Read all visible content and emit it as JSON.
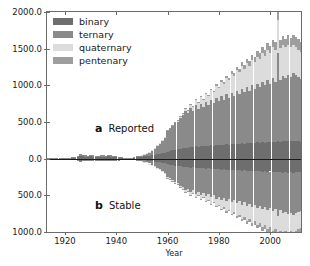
{
  "figure": {
    "width": 310,
    "height": 266,
    "background": "#ffffff"
  },
  "legend": {
    "position": "upper-left-inside",
    "entries": [
      {
        "label": "binary",
        "color": "#6e6e6e"
      },
      {
        "label": "ternary",
        "color": "#8a8a8a"
      },
      {
        "label": "quaternary",
        "color": "#dcdcdc"
      },
      {
        "label": "pentenary",
        "color": "#9e9e9e"
      }
    ]
  },
  "annotations": [
    {
      "letter": "a",
      "text": "Reported",
      "panel": "upper"
    },
    {
      "letter": "b",
      "text": "Stable",
      "panel": "lower"
    }
  ],
  "axes": {
    "xlabel": "Year",
    "ylabel": "# of Structures Discovered in Year",
    "xticks": [
      1920,
      1940,
      1960,
      1980,
      2000
    ],
    "xticklabels": [
      "1920",
      "1940",
      "1960",
      "1980",
      "2000"
    ],
    "yticks": [
      2000,
      1500,
      1000,
      500,
      0,
      -500,
      -1000
    ],
    "yticklabels": [
      "2000.0",
      "1500.0",
      "1000.0",
      "500.0",
      "0.0",
      "500.0",
      "1000.0"
    ],
    "xlim": [
      1913,
      2012
    ],
    "ylim": [
      -1000,
      2000
    ],
    "grid": false
  },
  "chart_data": {
    "type": "bar",
    "title": "",
    "xlabel": "Year",
    "ylabel": "# of Structures Discovered in Year",
    "xlim": [
      1913,
      2012
    ],
    "ylim": [
      -1000,
      2000
    ],
    "grid": false,
    "stacked": true,
    "orientation": "vertical",
    "mirrored": true,
    "panels": [
      {
        "id": "a",
        "name": "Reported",
        "sign": "positive"
      },
      {
        "id": "b",
        "name": "Stable",
        "sign": "negative"
      }
    ],
    "series_colors": {
      "binary": "#6e6e6e",
      "ternary": "#8a8a8a",
      "quaternary": "#dcdcdc",
      "pentenary": "#9e9e9e"
    },
    "x": [
      1913,
      1914,
      1915,
      1916,
      1917,
      1918,
      1919,
      1920,
      1921,
      1922,
      1923,
      1924,
      1925,
      1926,
      1927,
      1928,
      1929,
      1930,
      1931,
      1932,
      1933,
      1934,
      1935,
      1936,
      1937,
      1938,
      1939,
      1940,
      1941,
      1942,
      1943,
      1944,
      1945,
      1946,
      1947,
      1948,
      1949,
      1950,
      1951,
      1952,
      1953,
      1954,
      1955,
      1956,
      1957,
      1958,
      1959,
      1960,
      1961,
      1962,
      1963,
      1964,
      1965,
      1966,
      1967,
      1968,
      1969,
      1970,
      1971,
      1972,
      1973,
      1974,
      1975,
      1976,
      1977,
      1978,
      1979,
      1980,
      1981,
      1982,
      1983,
      1984,
      1985,
      1986,
      1987,
      1988,
      1989,
      1990,
      1991,
      1992,
      1993,
      1994,
      1995,
      1996,
      1997,
      1998,
      1999,
      2000,
      2001,
      2002,
      2003,
      2004,
      2005,
      2006,
      2007,
      2008,
      2009,
      2010,
      2011,
      2012
    ],
    "reported": {
      "binary": [
        2,
        3,
        2,
        4,
        3,
        5,
        4,
        6,
        8,
        7,
        10,
        12,
        22,
        35,
        30,
        26,
        24,
        30,
        28,
        24,
        22,
        26,
        28,
        24,
        30,
        26,
        22,
        20,
        16,
        12,
        8,
        6,
        5,
        8,
        12,
        18,
        22,
        28,
        30,
        34,
        40,
        46,
        52,
        58,
        64,
        72,
        80,
        96,
        104,
        112,
        120,
        126,
        134,
        140,
        150,
        146,
        160,
        154,
        168,
        160,
        172,
        166,
        178,
        170,
        182,
        176,
        188,
        180,
        192,
        186,
        198,
        190,
        200,
        196,
        206,
        200,
        210,
        204,
        214,
        208,
        218,
        212,
        222,
        216,
        226,
        220,
        230,
        224,
        234,
        228,
        238,
        232,
        242,
        236,
        246,
        240,
        244,
        238,
        236,
        230
      ],
      "ternary": [
        1,
        1,
        2,
        2,
        2,
        3,
        3,
        4,
        5,
        5,
        8,
        10,
        16,
        24,
        20,
        18,
        16,
        20,
        18,
        16,
        14,
        18,
        20,
        16,
        20,
        18,
        14,
        12,
        10,
        8,
        6,
        4,
        4,
        6,
        10,
        14,
        18,
        24,
        30,
        40,
        54,
        70,
        96,
        120,
        150,
        180,
        210,
        280,
        300,
        330,
        360,
        380,
        420,
        450,
        500,
        470,
        530,
        490,
        560,
        520,
        580,
        540,
        600,
        560,
        620,
        580,
        640,
        600,
        660,
        620,
        680,
        640,
        700,
        660,
        720,
        680,
        740,
        700,
        760,
        720,
        780,
        740,
        800,
        760,
        820,
        780,
        840,
        800,
        860,
        820,
        1200,
        840,
        880,
        860,
        900,
        880,
        920,
        900,
        880,
        860
      ],
      "quaternary": [
        0,
        0,
        0,
        0,
        0,
        0,
        0,
        0,
        0,
        0,
        0,
        0,
        0,
        0,
        0,
        0,
        0,
        0,
        0,
        0,
        0,
        0,
        0,
        0,
        0,
        0,
        0,
        0,
        0,
        0,
        0,
        0,
        0,
        0,
        0,
        0,
        0,
        1,
        1,
        2,
        2,
        3,
        4,
        5,
        6,
        8,
        10,
        14,
        16,
        18,
        22,
        26,
        30,
        36,
        42,
        48,
        56,
        64,
        72,
        80,
        90,
        100,
        112,
        124,
        136,
        150,
        164,
        180,
        194,
        210,
        224,
        240,
        254,
        270,
        284,
        300,
        310,
        320,
        330,
        340,
        350,
        360,
        370,
        380,
        390,
        400,
        410,
        420,
        430,
        440,
        450,
        440,
        430,
        420,
        410,
        400,
        390,
        380,
        370,
        360
      ],
      "pentenary": [
        0,
        0,
        0,
        0,
        0,
        0,
        0,
        0,
        0,
        0,
        0,
        0,
        0,
        0,
        0,
        0,
        0,
        0,
        0,
        0,
        0,
        0,
        0,
        0,
        0,
        0,
        0,
        0,
        0,
        0,
        0,
        0,
        0,
        0,
        0,
        0,
        0,
        0,
        0,
        0,
        0,
        0,
        0,
        0,
        0,
        0,
        0,
        1,
        1,
        1,
        2,
        2,
        3,
        3,
        4,
        4,
        5,
        6,
        7,
        8,
        9,
        10,
        12,
        14,
        16,
        18,
        20,
        22,
        25,
        28,
        31,
        34,
        37,
        40,
        44,
        48,
        52,
        56,
        60,
        64,
        68,
        72,
        76,
        80,
        84,
        88,
        92,
        96,
        100,
        104,
        108,
        112,
        116,
        120,
        124,
        128,
        132,
        136,
        140,
        144
      ]
    },
    "stable": {
      "binary": [
        1,
        2,
        2,
        3,
        2,
        4,
        3,
        5,
        6,
        6,
        8,
        10,
        16,
        26,
        22,
        20,
        18,
        22,
        20,
        18,
        16,
        20,
        22,
        18,
        22,
        20,
        16,
        14,
        12,
        10,
        6,
        5,
        4,
        6,
        9,
        13,
        17,
        21,
        24,
        27,
        32,
        36,
        41,
        46,
        51,
        57,
        63,
        75,
        82,
        88,
        94,
        99,
        105,
        110,
        118,
        114,
        125,
        120,
        131,
        125,
        134,
        129,
        139,
        133,
        142,
        137,
        147,
        141,
        150,
        145,
        155,
        148,
        156,
        153,
        161,
        156,
        164,
        159,
        167,
        162,
        170,
        166,
        173,
        169,
        176,
        172,
        179,
        175,
        182,
        178,
        186,
        181,
        189,
        184,
        192,
        187,
        190,
        185,
        184,
        179
      ],
      "ternary": [
        1,
        1,
        1,
        1,
        1,
        2,
        2,
        2,
        3,
        3,
        5,
        6,
        10,
        15,
        13,
        11,
        10,
        12,
        11,
        10,
        9,
        11,
        12,
        10,
        12,
        11,
        9,
        8,
        6,
        5,
        4,
        3,
        2,
        4,
        6,
        9,
        11,
        15,
        19,
        25,
        34,
        44,
        60,
        75,
        94,
        112,
        131,
        175,
        187,
        206,
        225,
        237,
        262,
        281,
        312,
        293,
        331,
        306,
        350,
        325,
        362,
        337,
        375,
        350,
        387,
        362,
        400,
        375,
        412,
        387,
        425,
        400,
        437,
        412,
        450,
        425,
        462,
        437,
        475,
        450,
        487,
        462,
        500,
        475,
        512,
        487,
        525,
        500,
        537,
        512,
        600,
        525,
        550,
        537,
        562,
        550,
        575,
        562,
        550,
        537
      ],
      "quaternary": [
        0,
        0,
        0,
        0,
        0,
        0,
        0,
        0,
        0,
        0,
        0,
        0,
        0,
        0,
        0,
        0,
        0,
        0,
        0,
        0,
        0,
        0,
        0,
        0,
        0,
        0,
        0,
        0,
        0,
        0,
        0,
        0,
        0,
        0,
        0,
        0,
        0,
        1,
        1,
        1,
        1,
        2,
        2,
        3,
        4,
        5,
        6,
        9,
        10,
        11,
        14,
        16,
        19,
        22,
        26,
        30,
        35,
        40,
        45,
        50,
        56,
        62,
        70,
        78,
        85,
        94,
        102,
        112,
        121,
        131,
        140,
        150,
        159,
        169,
        177,
        187,
        194,
        200,
        206,
        212,
        219,
        225,
        231,
        237,
        244,
        250,
        256,
        262,
        269,
        275,
        281,
        275,
        269,
        262,
        256,
        250,
        244,
        237,
        231,
        225
      ],
      "pentenary": [
        0,
        0,
        0,
        0,
        0,
        0,
        0,
        0,
        0,
        0,
        0,
        0,
        0,
        0,
        0,
        0,
        0,
        0,
        0,
        0,
        0,
        0,
        0,
        0,
        0,
        0,
        0,
        0,
        0,
        0,
        0,
        0,
        0,
        0,
        0,
        0,
        0,
        0,
        0,
        0,
        0,
        0,
        0,
        0,
        0,
        0,
        0,
        1,
        1,
        1,
        1,
        1,
        2,
        2,
        2,
        3,
        3,
        4,
        4,
        5,
        6,
        6,
        7,
        9,
        10,
        11,
        12,
        14,
        16,
        17,
        19,
        21,
        23,
        25,
        27,
        30,
        32,
        35,
        37,
        40,
        42,
        45,
        47,
        50,
        52,
        55,
        57,
        60,
        62,
        65,
        67,
        70,
        72,
        75,
        77,
        80,
        82,
        85,
        87,
        90
      ]
    }
  }
}
